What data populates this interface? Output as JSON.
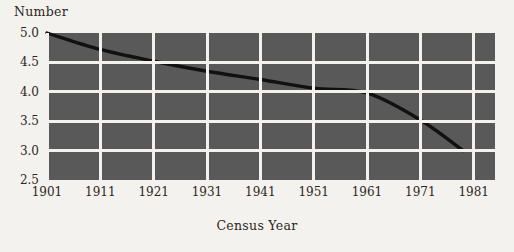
{
  "chart_data": {
    "type": "line",
    "title": "",
    "xlabel": "Census Year",
    "ylabel": "Number",
    "xlim": [
      1901,
      1985
    ],
    "ylim": [
      2.5,
      5.0
    ],
    "grid": true,
    "legend": false,
    "x_ticks": [
      "1901",
      "1911",
      "1921",
      "1931",
      "1941",
      "1951",
      "1961",
      "1971",
      "1981"
    ],
    "y_ticks": [
      "2.5",
      "3.0",
      "3.5",
      "4.0",
      "4.5",
      "5.0"
    ],
    "x": [
      1901,
      1911,
      1921,
      1931,
      1941,
      1951,
      1961,
      1971,
      1979
    ],
    "values": [
      5.0,
      4.72,
      4.52,
      4.35,
      4.21,
      4.06,
      3.98,
      3.52,
      3.0
    ],
    "series": [
      {
        "name": "Number",
        "values": [
          5.0,
          4.72,
          4.52,
          4.35,
          4.21,
          4.06,
          3.98,
          3.52,
          3.0
        ]
      }
    ],
    "colors": {
      "plot_background": "#595959",
      "gridline": "#f4f2ee",
      "line": "#111111",
      "page_background": "#f4f2ee",
      "text": "#2b2722"
    }
  }
}
